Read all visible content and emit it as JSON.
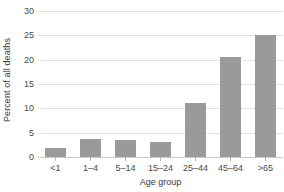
{
  "chart_data": {
    "type": "bar",
    "title": "",
    "subtitle": "",
    "xlabel": "Age group",
    "ylabel": "Percent of all deaths",
    "categories": [
      "<1",
      "1–4",
      "5–14",
      "15–24",
      "25–44",
      "45–64",
      ">65"
    ],
    "values": [
      1.8,
      3.8,
      3.5,
      3.1,
      11.2,
      20.5,
      25.1
    ],
    "ylim": [
      0,
      30
    ],
    "yticks": [
      0,
      5,
      10,
      15,
      20,
      25,
      30
    ],
    "ytick_labels": [
      "0",
      "5",
      "10",
      "15",
      "20",
      "25",
      "30"
    ],
    "grid": true,
    "legend": false,
    "legend_position": "none",
    "bar_color": "#9a9a9a",
    "gridline_color": "#e2e2e2",
    "axis_color": "#c9c9c9",
    "background_color": "#ffffff"
  }
}
